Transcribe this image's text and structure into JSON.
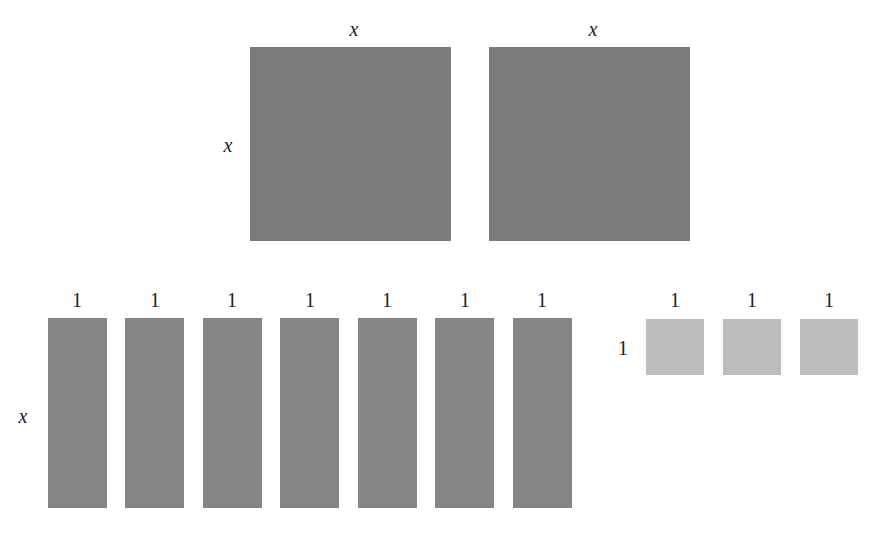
{
  "diagram": {
    "colors": {
      "x_squared": "#7b7b7b",
      "x": "#858585",
      "unit": "#bdbdbd",
      "background": "#ffffff"
    },
    "x_squared_tiles": {
      "count": 2,
      "top_labels": [
        "x",
        "x"
      ],
      "side_label": "x"
    },
    "x_tiles": {
      "count": 7,
      "top_labels": [
        "1",
        "1",
        "1",
        "1",
        "1",
        "1",
        "1"
      ],
      "side_label": "x"
    },
    "unit_tiles": {
      "count": 3,
      "top_labels": [
        "1",
        "1",
        "1"
      ],
      "side_label": "1"
    }
  }
}
